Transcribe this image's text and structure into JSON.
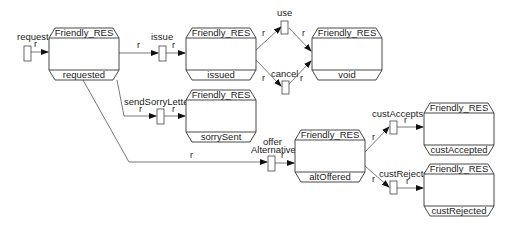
{
  "diagram": {
    "colors": {
      "background": "#ffffff",
      "stroke": "#333333",
      "arrow": "#111111",
      "text": "#222222"
    },
    "states": [
      {
        "id": "requested",
        "type": "Friendly_RES",
        "state": "requested",
        "x": 49,
        "y": 28,
        "w": 70,
        "h": 52
      },
      {
        "id": "issued",
        "type": "Friendly_RES",
        "state": "issued",
        "x": 186,
        "y": 28,
        "w": 70,
        "h": 52
      },
      {
        "id": "void",
        "type": "Friendly_RES",
        "state": "void",
        "x": 312,
        "y": 28,
        "w": 70,
        "h": 52
      },
      {
        "id": "sorrySent",
        "type": "Friendly_RES",
        "state": "sorrySent",
        "x": 186,
        "y": 90,
        "w": 70,
        "h": 52
      },
      {
        "id": "altOffered",
        "type": "Friendly_RES",
        "state": "altOffered",
        "x": 295,
        "y": 130,
        "w": 70,
        "h": 52
      },
      {
        "id": "custAccepted",
        "type": "Friendly_RES",
        "state": "custAccepted",
        "x": 424,
        "y": 103,
        "w": 70,
        "h": 52
      },
      {
        "id": "custRejected",
        "type": "Friendly_RES",
        "state": "custRejected",
        "x": 424,
        "y": 164,
        "w": 70,
        "h": 52
      }
    ],
    "transitions": [
      {
        "id": "request",
        "label": "request",
        "x": 24,
        "y": 46
      },
      {
        "id": "issue",
        "label": "issue",
        "x": 159,
        "y": 46
      },
      {
        "id": "use",
        "label": "use",
        "x": 282,
        "y": 21
      },
      {
        "id": "cancel",
        "label": "cancel",
        "x": 282,
        "y": 81
      },
      {
        "id": "sendSorryLetter",
        "label": "sendSorryLetter",
        "x": 157,
        "y": 110
      },
      {
        "id": "offerAlternative",
        "label_line1": "offer",
        "label_line2": "Alternative",
        "x": 268,
        "y": 158
      },
      {
        "id": "custAccepts",
        "label": "custAccepts",
        "x": 390,
        "y": 120
      },
      {
        "id": "custRejects",
        "label": "custRejects",
        "x": 390,
        "y": 180
      }
    ],
    "edge_label": "r"
  }
}
